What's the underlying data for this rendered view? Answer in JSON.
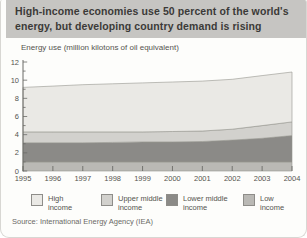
{
  "header": {
    "title": "High-income economies use 50 percent of the world's energy, but developing country demand is rising"
  },
  "source": {
    "text": "Source: International Energy Agency (IEA)"
  },
  "chart_data": {
    "type": "area",
    "stacked": true,
    "title": "Energy use (million kilotons of oil equivalent)",
    "x": [
      1995,
      1996,
      1997,
      1998,
      1999,
      2000,
      2001,
      2002,
      2003,
      2004
    ],
    "xlabel": "",
    "ylabel": "",
    "ylim": [
      0,
      12
    ],
    "ytick_labels": [
      0,
      2,
      4,
      6,
      8,
      10,
      12
    ],
    "grid": false,
    "legend_position": "bottom",
    "series": [
      {
        "name": "Low income",
        "color": "#bab9b5",
        "values": [
          1.0,
          1.0,
          1.0,
          1.0,
          1.0,
          1.0,
          1.0,
          1.0,
          1.0,
          1.0
        ]
      },
      {
        "name": "Lower middle income",
        "color": "#8b8a87",
        "values": [
          2.1,
          2.1,
          2.1,
          2.15,
          2.2,
          2.2,
          2.25,
          2.4,
          2.6,
          2.9
        ]
      },
      {
        "name": "Upper middle income",
        "color": "#d2d1cd",
        "values": [
          1.2,
          1.2,
          1.2,
          1.15,
          1.1,
          1.15,
          1.15,
          1.2,
          1.4,
          1.5
        ]
      },
      {
        "name": "High income",
        "color": "#eae9e5",
        "values": [
          4.9,
          5.05,
          5.2,
          5.3,
          5.4,
          5.45,
          5.5,
          5.5,
          5.5,
          5.5
        ]
      }
    ],
    "legend": [
      {
        "line1": "High",
        "line2": "income"
      },
      {
        "line1": "Upper middle",
        "line2": "income"
      },
      {
        "line1": "Lower middle",
        "line2": "income"
      },
      {
        "line1": "Low",
        "line2": "income"
      }
    ],
    "style": {
      "area_stroke": "#96958e",
      "axis_color": "#6b6b67",
      "header_bg": "#c6c5c2"
    }
  }
}
